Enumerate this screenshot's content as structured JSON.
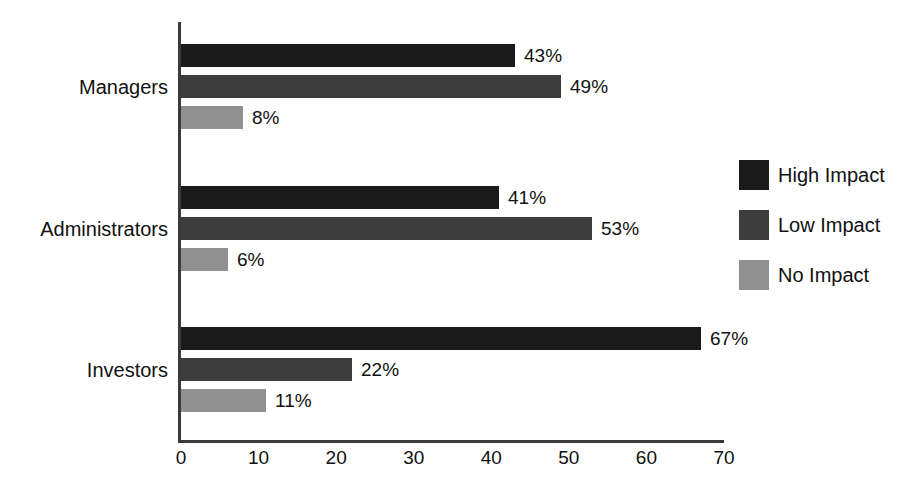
{
  "chart_data": {
    "type": "bar",
    "orientation": "horizontal",
    "title": "",
    "subtitle": "",
    "xlabel": "",
    "ylabel": "",
    "xlim": [
      0,
      70
    ],
    "xticks": [
      0,
      10,
      20,
      30,
      40,
      50,
      60,
      70
    ],
    "tick_labels": [
      "0",
      "10",
      "20",
      "30",
      "40",
      "50",
      "60",
      "70"
    ],
    "grid": false,
    "legend_position": "right",
    "value_suffix": "%",
    "categories": [
      "Managers",
      "Administrators",
      "Investors"
    ],
    "series": [
      {
        "name": "High Impact",
        "color": "#1a1a1a",
        "values": [
          43,
          41,
          67
        ],
        "labels": [
          "43%",
          "41%",
          "67%"
        ]
      },
      {
        "name": "Low Impact",
        "color": "#3d3d3d",
        "values": [
          49,
          53,
          22
        ],
        "labels": [
          "49%",
          "53%",
          "22%"
        ]
      },
      {
        "name": "No Impact",
        "color": "#909090",
        "values": [
          8,
          6,
          11
        ],
        "labels": [
          "8%",
          "6%",
          "11%"
        ]
      }
    ]
  },
  "legend": {
    "items": [
      {
        "label": "High Impact",
        "color": "#1a1a1a"
      },
      {
        "label": "Low Impact",
        "color": "#3d3d3d"
      },
      {
        "label": "No Impact",
        "color": "#909090"
      }
    ]
  },
  "axis": {
    "x_tick_labels": [
      "0",
      "10",
      "20",
      "30",
      "40",
      "50",
      "60",
      "70"
    ],
    "category_labels": [
      "Managers",
      "Administrators",
      "Investors"
    ]
  },
  "colors": {
    "background": "#ffffff",
    "axis": "#3a3a3a",
    "text": "#111111",
    "series_high_impact": "#1a1a1a",
    "series_low_impact": "#3d3d3d",
    "series_no_impact": "#909090"
  }
}
